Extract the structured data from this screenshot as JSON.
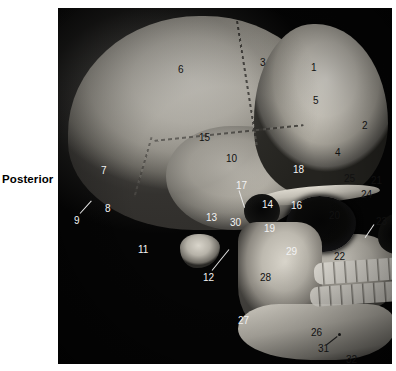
{
  "figure": {
    "orientation_label": "Posterior",
    "panel": {
      "background_color": "#050505",
      "view": "lateral skull"
    }
  },
  "callouts": [
    {
      "id": "1",
      "text": "1",
      "x": 311,
      "y": 63,
      "tone": "dark"
    },
    {
      "id": "2",
      "text": "2",
      "x": 362,
      "y": 121,
      "tone": "dark"
    },
    {
      "id": "3",
      "text": "3",
      "x": 260,
      "y": 58,
      "tone": "dark"
    },
    {
      "id": "4",
      "text": "4",
      "x": 335,
      "y": 148,
      "tone": "dark"
    },
    {
      "id": "5",
      "text": "5",
      "x": 313,
      "y": 96,
      "tone": "dark"
    },
    {
      "id": "6",
      "text": "6",
      "x": 178,
      "y": 65,
      "tone": "dark"
    },
    {
      "id": "7",
      "text": "7",
      "x": 101,
      "y": 166,
      "tone": "light"
    },
    {
      "id": "8",
      "text": "8",
      "x": 105,
      "y": 204,
      "tone": "light"
    },
    {
      "id": "9",
      "text": "9",
      "x": 74,
      "y": 216,
      "tone": "light"
    },
    {
      "id": "10",
      "text": "10",
      "x": 226,
      "y": 154,
      "tone": "dark"
    },
    {
      "id": "11",
      "text": "11",
      "x": 138,
      "y": 245,
      "tone": "light"
    },
    {
      "id": "12",
      "text": "12",
      "x": 203,
      "y": 273,
      "tone": "light"
    },
    {
      "id": "13",
      "text": "13",
      "x": 206,
      "y": 213,
      "tone": "light"
    },
    {
      "id": "14",
      "text": "14",
      "x": 262,
      "y": 200,
      "tone": "light"
    },
    {
      "id": "15",
      "text": "15",
      "x": 199,
      "y": 133,
      "tone": "dark"
    },
    {
      "id": "16",
      "text": "16",
      "x": 291,
      "y": 201,
      "tone": "light"
    },
    {
      "id": "17",
      "text": "17",
      "x": 236,
      "y": 181,
      "tone": "light"
    },
    {
      "id": "18",
      "text": "18",
      "x": 293,
      "y": 165,
      "tone": "light"
    },
    {
      "id": "19",
      "text": "19",
      "x": 264,
      "y": 224,
      "tone": "light"
    },
    {
      "id": "20",
      "text": "20",
      "x": 329,
      "y": 211,
      "tone": "dark"
    },
    {
      "id": "21",
      "text": "21",
      "x": 371,
      "y": 176,
      "tone": "dark"
    },
    {
      "id": "22",
      "text": "22",
      "x": 334,
      "y": 252,
      "tone": "dark"
    },
    {
      "id": "23",
      "text": "23",
      "x": 376,
      "y": 217,
      "tone": "dark"
    },
    {
      "id": "24",
      "text": "24",
      "x": 361,
      "y": 190,
      "tone": "dark"
    },
    {
      "id": "25",
      "text": "25",
      "x": 344,
      "y": 174,
      "tone": "dark"
    },
    {
      "id": "26",
      "text": "26",
      "x": 311,
      "y": 328,
      "tone": "dark"
    },
    {
      "id": "27",
      "text": "27",
      "x": 238,
      "y": 316,
      "tone": "light"
    },
    {
      "id": "28",
      "text": "28",
      "x": 260,
      "y": 273,
      "tone": "dark"
    },
    {
      "id": "29",
      "text": "29",
      "x": 286,
      "y": 247,
      "tone": "light"
    },
    {
      "id": "30",
      "text": "30",
      "x": 230,
      "y": 218,
      "tone": "light"
    },
    {
      "id": "31",
      "text": "31",
      "x": 318,
      "y": 344,
      "tone": "dark"
    },
    {
      "id": "32",
      "text": "32",
      "x": 346,
      "y": 355,
      "tone": "dark"
    }
  ],
  "leaders": [
    {
      "name": "leader-9",
      "x": 80,
      "y": 213,
      "length": 17,
      "angle": -48,
      "tone": "light"
    },
    {
      "name": "leader-12",
      "x": 212,
      "y": 270,
      "length": 27,
      "angle": -51,
      "tone": "light"
    },
    {
      "name": "leader-17",
      "x": 239,
      "y": 190,
      "length": 18,
      "angle": 72,
      "tone": "light"
    },
    {
      "name": "leader-23",
      "x": 374,
      "y": 224,
      "length": 16,
      "angle": 124,
      "tone": "light"
    },
    {
      "name": "leader-31",
      "x": 327,
      "y": 344,
      "length": 13,
      "angle": -38,
      "tone": "dark-line"
    }
  ],
  "leader_dots": [
    {
      "name": "mental-foramen-dot",
      "x": 338,
      "y": 333
    }
  ]
}
